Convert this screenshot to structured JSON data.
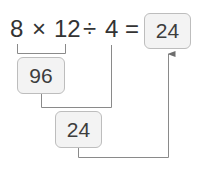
{
  "expression": {
    "tokens": [
      "8",
      "×",
      "12",
      "÷",
      "4",
      "="
    ],
    "result": "24"
  },
  "steps": [
    {
      "label": "96",
      "from": "8 × 12"
    },
    {
      "label": "24",
      "from": "96 ÷ 4"
    }
  ],
  "colors": {
    "text": "#333333",
    "box_fill": "#f3f3f3",
    "box_border": "#bdbdbd",
    "line": "#8a8a8a"
  }
}
